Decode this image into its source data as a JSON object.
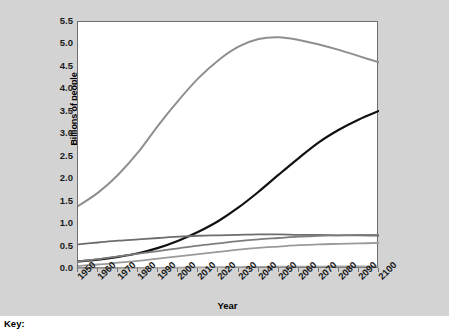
{
  "chart_data": {
    "type": "line",
    "title": "",
    "xlabel": "Year",
    "ylabel": "Billions of people",
    "xlim": [
      1950,
      2100
    ],
    "ylim": [
      0.0,
      5.5
    ],
    "grid": false,
    "legend_position": "below-figure",
    "x": [
      1950,
      1960,
      1970,
      1980,
      1990,
      2000,
      2010,
      2020,
      2030,
      2040,
      2050,
      2060,
      2070,
      2080,
      2090,
      2100
    ],
    "x_tick_labels": [
      "1950",
      "1960",
      "1970",
      "1980",
      "1990",
      "2000",
      "2010",
      "2020",
      "2030",
      "2040",
      "2050",
      "2060",
      "2070",
      "2080",
      "2090",
      "2100"
    ],
    "y_tick_labels": [
      "0.0",
      "0.5",
      "1.0",
      "1.5",
      "2.0",
      "2.5",
      "3.0",
      "3.5",
      "4.0",
      "4.5",
      "5.0",
      "5.5"
    ],
    "y_ticks": [
      0.0,
      0.5,
      1.0,
      1.5,
      2.0,
      2.5,
      3.0,
      3.5,
      4.0,
      4.5,
      5.0,
      5.5
    ],
    "series": [
      {
        "name": "series-1",
        "color": "#8f8f8f",
        "width": 2.0,
        "values": [
          1.4,
          1.7,
          2.1,
          2.6,
          3.2,
          3.75,
          4.25,
          4.65,
          4.95,
          5.12,
          5.16,
          5.1,
          5.0,
          4.88,
          4.74,
          4.6
        ]
      },
      {
        "name": "series-2",
        "color": "#111111",
        "width": 2.2,
        "values": [
          0.17,
          0.21,
          0.27,
          0.35,
          0.47,
          0.63,
          0.83,
          1.07,
          1.37,
          1.72,
          2.1,
          2.47,
          2.82,
          3.1,
          3.33,
          3.52
        ]
      },
      {
        "name": "series-3",
        "color": "#6d6d6d",
        "width": 1.8,
        "values": [
          0.55,
          0.59,
          0.63,
          0.66,
          0.69,
          0.72,
          0.74,
          0.75,
          0.76,
          0.77,
          0.77,
          0.76,
          0.76,
          0.75,
          0.75,
          0.74
        ]
      },
      {
        "name": "series-4",
        "color": "#7d7d7d",
        "width": 1.8,
        "values": [
          0.17,
          0.22,
          0.28,
          0.34,
          0.4,
          0.46,
          0.52,
          0.57,
          0.62,
          0.66,
          0.69,
          0.72,
          0.74,
          0.75,
          0.76,
          0.76
        ]
      },
      {
        "name": "series-5",
        "color": "#9a9a9a",
        "width": 1.8,
        "values": [
          0.07,
          0.1,
          0.14,
          0.18,
          0.23,
          0.28,
          0.33,
          0.38,
          0.43,
          0.47,
          0.5,
          0.53,
          0.55,
          0.56,
          0.57,
          0.58
        ]
      },
      {
        "name": "series-6",
        "color": "#a5a5a5",
        "width": 1.6,
        "values": [
          0.013,
          0.015,
          0.019,
          0.023,
          0.027,
          0.031,
          0.036,
          0.041,
          0.045,
          0.049,
          0.052,
          0.055,
          0.057,
          0.058,
          0.059,
          0.06
        ]
      }
    ]
  },
  "key": {
    "label": "Key:"
  },
  "colors": {
    "figure_background": "#d3d3d3",
    "plot_background": "#ffffff",
    "axis": "#6f6f6f",
    "text": "#000000"
  }
}
